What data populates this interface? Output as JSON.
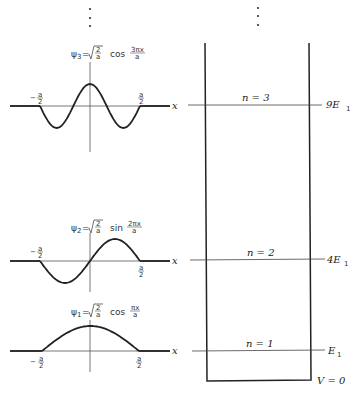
{
  "figure": {
    "continuation_dots": "⋮"
  },
  "wavefunctions": [
    {
      "id": "psi3",
      "n": 3,
      "label_lhs": "ψ",
      "label_sub": "3",
      "label_eq": "=",
      "sqrt_num": "2",
      "sqrt_den": "a",
      "func": "cos",
      "arg_num": "3πx",
      "arg_den": "a",
      "left_tick_label": "− a/2",
      "right_tick_label": "a/2",
      "axis_label": "x"
    },
    {
      "id": "psi2",
      "n": 2,
      "label_lhs": "ψ",
      "label_sub": "2",
      "label_eq": "=",
      "sqrt_num": "2",
      "sqrt_den": "a",
      "func": "sin",
      "arg_num": "2πx",
      "arg_den": "a",
      "left_tick_label": "− a/2",
      "right_tick_label": "a/2",
      "axis_label": "x"
    },
    {
      "id": "psi1",
      "n": 1,
      "label_lhs": "ψ",
      "label_sub": "1",
      "label_eq": "=",
      "sqrt_num": "2",
      "sqrt_den": "a",
      "func": "cos",
      "arg_num": "πx",
      "arg_den": "a",
      "left_tick_label": "− a/2",
      "right_tick_label": "a/2",
      "axis_label": "x"
    }
  ],
  "tick_parts": {
    "minus": "−",
    "num": "a",
    "den": "2"
  },
  "energy_levels": [
    {
      "n_label": "n = 3",
      "energy": "9E",
      "energy_sub": "1"
    },
    {
      "n_label": "n = 2",
      "energy": "4E",
      "energy_sub": "1"
    },
    {
      "n_label": "n = 1",
      "energy": "E",
      "energy_sub": "1"
    }
  ],
  "well": {
    "bottom_label": "V = 0"
  }
}
